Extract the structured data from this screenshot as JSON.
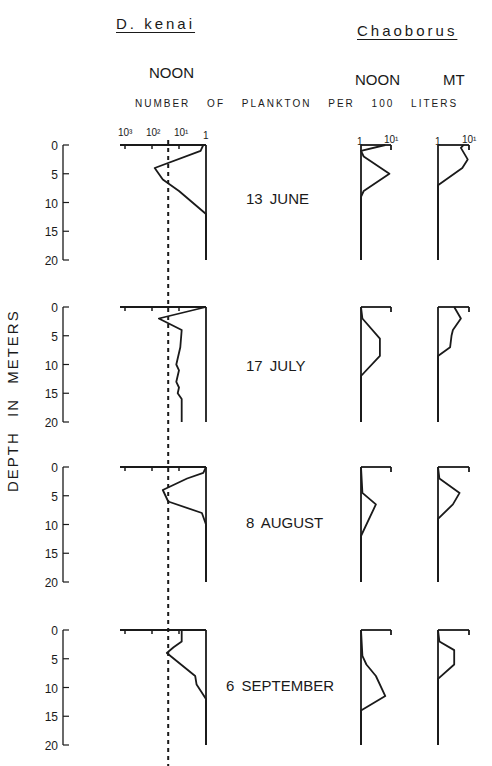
{
  "header": {
    "left_species": "D. kenai",
    "right_species": "Chaoborus",
    "left_time": "NOON",
    "right_time_1": "NOON",
    "right_time_2": "MT",
    "x_axis_label": "NUMBER OF PLANKTON PER 100 LITERS",
    "y_axis_label": "DEPTH IN METERS"
  },
  "ticks": {
    "dkenai": [
      "10³",
      "10²",
      "10¹",
      "1"
    ],
    "chaob_noon": [
      "1",
      "10¹"
    ],
    "chaob_mt": [
      "1",
      "10¹"
    ],
    "depth": [
      "0",
      "5",
      "10",
      "15",
      "20"
    ]
  },
  "dates": [
    "13 JUNE",
    "17 JULY",
    "8 AUGUST",
    "6 SEPTEMBER"
  ],
  "colors": {
    "ink": "#1a1a1a",
    "background": "#ffffff"
  },
  "chart_data": {
    "type": "line",
    "xlabel": "NUMBER OF PLANKTON PER 100 LITERS (log scale, reversed for D. kenai)",
    "ylabel": "DEPTH IN METERS",
    "ylim": [
      0,
      20
    ],
    "y_ticks": [
      0,
      5,
      10,
      15,
      20
    ],
    "dashed_reference_line": {
      "series": "D. kenai",
      "value_log10": 1.4
    },
    "panels": [
      {
        "date": "13 JUNE",
        "series": [
          {
            "name": "D. kenai NOON",
            "depth": [
              0,
              1,
              4,
              6,
              8,
              12,
              20
            ],
            "log10_count": [
              0.1,
              0.2,
              1.9,
              1.6,
              1.0,
              0.0,
              0.0
            ]
          },
          {
            "name": "Chaoborus NOON",
            "depth": [
              0,
              1,
              2,
              5,
              8,
              9,
              20
            ],
            "log10_count": [
              0.9,
              0.0,
              0.1,
              1.05,
              0.1,
              0.0,
              0.0
            ]
          },
          {
            "name": "Chaoborus MT",
            "depth": [
              0,
              0.5,
              2.5,
              4,
              7,
              20
            ],
            "log10_count": [
              0.95,
              0.85,
              1.1,
              0.9,
              0.0,
              0.0
            ]
          }
        ]
      },
      {
        "date": "17 JULY",
        "series": [
          {
            "name": "D. kenai NOON",
            "depth": [
              0,
              2,
              4,
              7,
              10,
              11,
              13,
              14,
              15,
              16,
              20
            ],
            "log10_count": [
              0.0,
              1.75,
              0.9,
              0.95,
              1.1,
              1.0,
              1.1,
              1.0,
              1.05,
              0.9,
              0.9
            ]
          },
          {
            "name": "Chaoborus NOON",
            "depth": [
              0,
              2,
              5.5,
              8.5,
              12,
              20
            ],
            "log10_count": [
              0.0,
              0.05,
              0.7,
              0.7,
              0.0,
              0.0
            ]
          },
          {
            "name": "Chaoborus MT",
            "depth": [
              0,
              2,
              4,
              5,
              7,
              8.5,
              20
            ],
            "log10_count": [
              0.6,
              0.85,
              0.55,
              0.5,
              0.45,
              0.0,
              0.0
            ]
          }
        ]
      },
      {
        "date": "8 AUGUST",
        "series": [
          {
            "name": "D. kenai NOON",
            "depth": [
              0,
              1,
              2,
              4,
              6,
              8,
              10,
              20
            ],
            "log10_count": [
              0.0,
              0.1,
              0.7,
              1.6,
              1.4,
              0.15,
              0.0,
              0.0
            ]
          },
          {
            "name": "Chaoborus NOON",
            "depth": [
              0,
              4.5,
              6.5,
              12,
              20
            ],
            "log10_count": [
              0.0,
              0.05,
              0.55,
              0.0,
              0.0
            ]
          },
          {
            "name": "Chaoborus MT",
            "depth": [
              0,
              2,
              4.5,
              6.5,
              9,
              20
            ],
            "log10_count": [
              0.0,
              0.05,
              0.8,
              0.55,
              0.0,
              0.0
            ]
          }
        ]
      },
      {
        "date": "6 SEPTEMBER",
        "series": [
          {
            "name": "D. kenai NOON",
            "depth": [
              0,
              2,
              3,
              4,
              8,
              9.5,
              12,
              20
            ],
            "log10_count": [
              0.9,
              0.9,
              1.2,
              1.45,
              0.4,
              0.35,
              0.0,
              0.0
            ]
          },
          {
            "name": "Chaoborus NOON",
            "depth": [
              0,
              4.5,
              6,
              8,
              11.5,
              14,
              15,
              20
            ],
            "log10_count": [
              0.0,
              0.05,
              0.2,
              0.55,
              0.9,
              0.0,
              0.0,
              0.0
            ]
          },
          {
            "name": "Chaoborus MT",
            "depth": [
              0,
              2,
              3.5,
              6,
              8.5,
              20
            ],
            "log10_count": [
              0.0,
              0.05,
              0.6,
              0.6,
              0.0,
              0.0
            ]
          }
        ]
      }
    ],
    "grid": false,
    "legend": "none"
  }
}
